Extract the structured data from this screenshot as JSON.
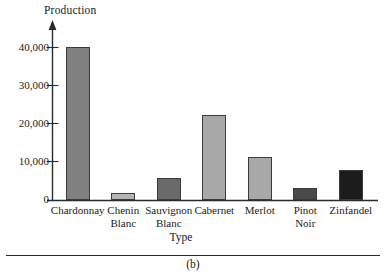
{
  "figure": {
    "caption": "(b)",
    "caption_rule": true
  },
  "chart_data": {
    "type": "bar",
    "title": "",
    "xlabel": "Type",
    "ylabel": "Production",
    "categories": [
      "Chardonnay",
      "Chenin\nBlanc",
      "Sauvignon\nBlanc",
      "Cabernet",
      "Merlot",
      "Pinot\nNoir",
      "Zinfandel"
    ],
    "values": [
      40000,
      1700,
      5800,
      22200,
      11200,
      3100,
      7800
    ],
    "bar_colors": [
      "#808080",
      "#b4b4b4",
      "#6a6a6a",
      "#a8a8a8",
      "#a8a8a8",
      "#4a4a4a",
      "#1c1c1c"
    ],
    "bar_edge_color": "#3b3b3b",
    "ylim": [
      0,
      43000
    ],
    "yticks": [
      0,
      10000,
      20000,
      30000,
      40000
    ],
    "ytick_labels": [
      "0",
      "10,000",
      "20,000",
      "30,000",
      "40,000"
    ],
    "grid": false,
    "legend": null,
    "axis_arrow": true,
    "axis_color": "#2b2b2b"
  }
}
